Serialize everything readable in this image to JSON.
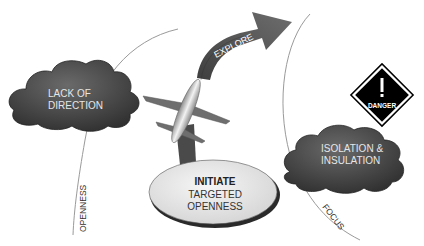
{
  "diagram": {
    "clouds": [
      {
        "id": "lack-of-direction",
        "lines": [
          "LACK OF",
          "DIRECTION"
        ]
      },
      {
        "id": "isolation",
        "lines": [
          "ISOLATION &",
          "INSULATION"
        ]
      }
    ],
    "arrow": {
      "label": "EXPLORE"
    },
    "ellipse": {
      "title": "INITIATE",
      "lines": [
        "TARGETED",
        "OPENNESS"
      ]
    },
    "danger_sign": {
      "label": "DANGER",
      "glyph": "!"
    },
    "axis_labels": {
      "left": "OPENNESS",
      "right": "FOCUS"
    },
    "colors": {
      "cloud": "#4a4a4a",
      "arrow": "#5a5a5a",
      "plane": "#777777",
      "ellipse": "#e8e8e8",
      "sign": "#000000"
    }
  }
}
